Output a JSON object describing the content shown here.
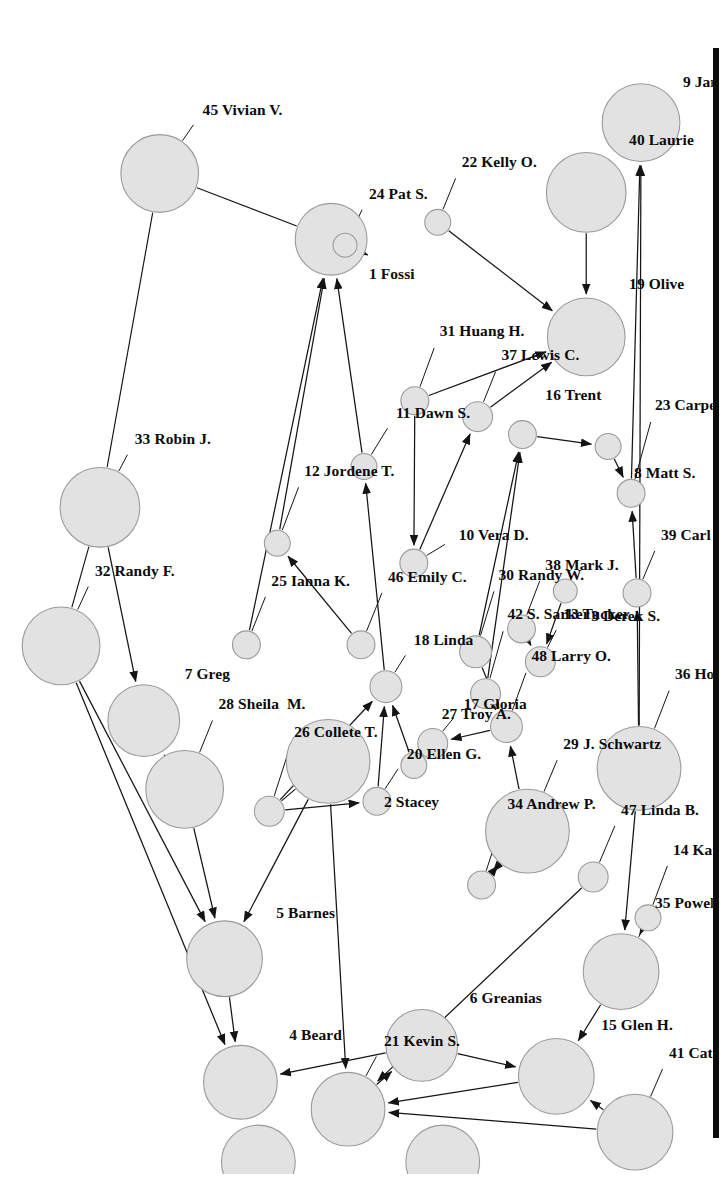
{
  "figure": {
    "type": "social-network-graph",
    "orientation": "rotated-90-clockwise",
    "node_count": 48,
    "background_color": "#ffffff",
    "node_fill_color": "#e2e2e2",
    "node_stroke_color": "#9a9a9a",
    "edge_color": "#141414",
    "page_edge_bar_color": "#0d0d0d"
  },
  "nodes": [
    {
      "id": 1,
      "label": "1 Fossi",
      "x": 222,
      "y": 383,
      "r": 36,
      "lx": 258,
      "ly": 345,
      "anchor": "start"
    },
    {
      "id": 2,
      "label": "2 Stacey",
      "x": 746,
      "y": 386,
      "r": 42,
      "lx": 788,
      "ly": 330,
      "anchor": "start"
    },
    {
      "id": 3,
      "label": "3 Derek S.",
      "x": 575,
      "y": 148,
      "r": 12,
      "lx": 602,
      "ly": 122,
      "anchor": "start"
    },
    {
      "id": 4,
      "label": "4 Beard",
      "x": 1068,
      "y": 474,
      "r": 37,
      "lx": 1022,
      "ly": 425,
      "anchor": "start"
    },
    {
      "id": 5,
      "label": "5 Barnes",
      "x": 944,
      "y": 490,
      "r": 38,
      "lx": 900,
      "ly": 438,
      "anchor": "start"
    },
    {
      "id": 6,
      "label": "6 Greanias",
      "x": 1031,
      "y": 292,
      "r": 36,
      "lx": 985,
      "ly": 244,
      "anchor": "start"
    },
    {
      "id": 7,
      "label": "7 Greg",
      "x": 705,
      "y": 571,
      "r": 36,
      "lx": 660,
      "ly": 530,
      "anchor": "start"
    },
    {
      "id": 8,
      "label": "8 Matt S.",
      "x": 430,
      "y": 105,
      "r": 13,
      "lx": 458,
      "ly": 79,
      "anchor": "start"
    },
    {
      "id": 9,
      "label": "9 Jana",
      "x": 105,
      "y": 72,
      "r": 39,
      "lx": 66,
      "ly": 30,
      "anchor": "start"
    },
    {
      "id": 10,
      "label": "10 Vera D.",
      "x": 547,
      "y": 300,
      "r": 14,
      "lx": 520,
      "ly": 255,
      "anchor": "start"
    },
    {
      "id": 11,
      "label": "11 Dawn S.",
      "x": 450,
      "y": 350,
      "r": 13,
      "lx": 398,
      "ly": 318,
      "anchor": "start"
    },
    {
      "id": 12,
      "label": "12 Jordene T.",
      "x": 527,
      "y": 437,
      "r": 13,
      "lx": 456,
      "ly": 410,
      "anchor": "start"
    },
    {
      "id": 13,
      "label": "13 Tucker",
      "x": 646,
      "y": 173,
      "r": 15,
      "lx": 600,
      "ly": 150,
      "anchor": "start"
    },
    {
      "id": 14,
      "label": "14 Kathy I",
      "x": 903,
      "y": 65,
      "r": 13,
      "lx": 836,
      "ly": 40,
      "anchor": "start"
    },
    {
      "id": 15,
      "label": "15 Glen H.",
      "x": 1062,
      "y": 157,
      "r": 38,
      "lx": 1012,
      "ly": 112,
      "anchor": "start"
    },
    {
      "id": 16,
      "label": "16 Trent",
      "x": 418,
      "y": 191,
      "r": 14,
      "lx": 380,
      "ly": 168,
      "anchor": "start"
    },
    {
      "id": 17,
      "label": "17 Gloria",
      "x": 728,
      "y": 281,
      "r": 15,
      "lx": 690,
      "ly": 250,
      "anchor": "start"
    },
    {
      "id": 18,
      "label": "18 Linda",
      "x": 671,
      "y": 328,
      "r": 16,
      "lx": 626,
      "ly": 300,
      "anchor": "start"
    },
    {
      "id": 19,
      "label": "19 Olive",
      "x": 320,
      "y": 127,
      "r": 39,
      "lx": 268,
      "ly": 84,
      "anchor": "start"
    },
    {
      "id": 20,
      "label": "20 Ellen G.",
      "x": 786,
      "y": 337,
      "r": 14,
      "lx": 740,
      "ly": 307,
      "anchor": "start"
    },
    {
      "id": 21,
      "label": "21 Kevin S.",
      "x": 1095,
      "y": 366,
      "r": 37,
      "lx": 1028,
      "ly": 330,
      "anchor": "start"
    },
    {
      "id": 22,
      "label": "22 Kelly O.",
      "x": 205,
      "y": 276,
      "r": 13,
      "lx": 146,
      "ly": 252,
      "anchor": "start"
    },
    {
      "id": 23,
      "label": "23 Carpenter",
      "x": 477,
      "y": 82,
      "r": 14,
      "lx": 390,
      "ly": 58,
      "anchor": "start"
    },
    {
      "id": 24,
      "label": "24 Pat S.",
      "x": 228,
      "y": 369,
      "r": 12,
      "lx": 178,
      "ly": 345,
      "anchor": "start"
    },
    {
      "id": 25,
      "label": "25 Ianna K.",
      "x": 629,
      "y": 468,
      "r": 14,
      "lx": 566,
      "ly": 443,
      "anchor": "start"
    },
    {
      "id": 26,
      "label": "26 Collete T.",
      "x": 796,
      "y": 445,
      "r": 15,
      "lx": 718,
      "ly": 420,
      "anchor": "start"
    },
    {
      "id": 27,
      "label": "27 Troy A.",
      "x": 750,
      "y": 300,
      "r": 13,
      "lx": 700,
      "ly": 272,
      "anchor": "start"
    },
    {
      "id": 28,
      "label": "28 Sheila  M.",
      "x": 774,
      "y": 530,
      "r": 39,
      "lx": 690,
      "ly": 496,
      "anchor": "start"
    },
    {
      "id": 29,
      "label": "29 J. Schwartz",
      "x": 816,
      "y": 186,
      "r": 42,
      "lx": 730,
      "ly": 150,
      "anchor": "start"
    },
    {
      "id": 30,
      "label": "30 Randy W.",
      "x": 636,
      "y": 238,
      "r": 16,
      "lx": 560,
      "ly": 215,
      "anchor": "start"
    },
    {
      "id": 31,
      "label": "31 Huang H.",
      "x": 384,
      "y": 299,
      "r": 14,
      "lx": 316,
      "ly": 274,
      "anchor": "start"
    },
    {
      "id": 32,
      "label": "32 Randy F.",
      "x": 630,
      "y": 654,
      "r": 39,
      "lx": 556,
      "ly": 620,
      "anchor": "start"
    },
    {
      "id": 33,
      "label": "33 Robin J.",
      "x": 491,
      "y": 615,
      "r": 40,
      "lx": 424,
      "ly": 580,
      "anchor": "start"
    },
    {
      "id": 34,
      "label": "34 Andrew P.",
      "x": 870,
      "y": 232,
      "r": 14,
      "lx": 790,
      "ly": 206,
      "anchor": "start"
    },
    {
      "id": 35,
      "label": "35 Powell",
      "x": 957,
      "y": 92,
      "r": 38,
      "lx": 890,
      "ly": 58,
      "anchor": "start"
    },
    {
      "id": 36,
      "label": "36 Holtzclaw",
      "x": 753,
      "y": 74,
      "r": 42,
      "lx": 660,
      "ly": 38,
      "anchor": "start"
    },
    {
      "id": 37,
      "label": "37 Lewis C.",
      "x": 400,
      "y": 236,
      "r": 15,
      "lx": 340,
      "ly": 212,
      "anchor": "start"
    },
    {
      "id": 38,
      "label": "38 Mark J.",
      "x": 613,
      "y": 192,
      "r": 14,
      "lx": 550,
      "ly": 168,
      "anchor": "start"
    },
    {
      "id": 39,
      "label": "39 Carl I.",
      "x": 577,
      "y": 76,
      "r": 14,
      "lx": 520,
      "ly": 52,
      "anchor": "start"
    },
    {
      "id": 40,
      "label": "40 Laurie",
      "x": 175,
      "y": 127,
      "r": 40,
      "lx": 124,
      "ly": 84,
      "anchor": "start"
    },
    {
      "id": 41,
      "label": "41 Cathy G.",
      "x": 1118,
      "y": 78,
      "r": 38,
      "lx": 1040,
      "ly": 44,
      "anchor": "start"
    },
    {
      "id": 42,
      "label": "42 S. Sarker",
      "x": 678,
      "y": 228,
      "r": 15,
      "lx": 600,
      "ly": 206,
      "anchor": "start"
    },
    {
      "id": 43,
      "label": "43",
      "x": 1148,
      "y": 271,
      "r": 37,
      "lx": 1148,
      "ly": 271,
      "anchor": "middle",
      "hide_label": true
    },
    {
      "id": 44,
      "label": "44",
      "x": 1148,
      "y": 456,
      "r": 37,
      "lx": 1148,
      "ly": 456,
      "anchor": "middle",
      "hide_label": true
    },
    {
      "id": 45,
      "label": "45 Vivian V.",
      "x": 156,
      "y": 555,
      "r": 39,
      "lx": 94,
      "ly": 512,
      "anchor": "start"
    },
    {
      "id": 46,
      "label": "46 Emily C.",
      "x": 629,
      "y": 353,
      "r": 14,
      "lx": 562,
      "ly": 326,
      "anchor": "start"
    },
    {
      "id": 47,
      "label": "47 Linda B.",
      "x": 862,
      "y": 120,
      "r": 15,
      "lx": 796,
      "ly": 92,
      "anchor": "start"
    },
    {
      "id": 48,
      "label": "48 Larry O.",
      "x": 711,
      "y": 207,
      "r": 16,
      "lx": 642,
      "ly": 182,
      "anchor": "start"
    }
  ],
  "edges": [
    {
      "from": 23,
      "to": 9,
      "arrow": true
    },
    {
      "from": 36,
      "to": 9,
      "arrow": true
    },
    {
      "from": 40,
      "to": 19,
      "arrow": true
    },
    {
      "from": 22,
      "to": 19,
      "arrow": true
    },
    {
      "from": 31,
      "to": 19,
      "arrow": true
    },
    {
      "from": 37,
      "to": 19,
      "arrow": true
    },
    {
      "from": 24,
      "to": 1,
      "arrow": true
    },
    {
      "from": 11,
      "to": 1,
      "arrow": true
    },
    {
      "from": 12,
      "to": 1,
      "arrow": true
    },
    {
      "from": 25,
      "to": 1,
      "arrow": true
    },
    {
      "from": 45,
      "to": 1,
      "arrow": false
    },
    {
      "from": 45,
      "to": 33,
      "arrow": false
    },
    {
      "from": 33,
      "to": 7,
      "arrow": true
    },
    {
      "from": 33,
      "to": 32,
      "arrow": false
    },
    {
      "from": 32,
      "to": 5,
      "arrow": true
    },
    {
      "from": 32,
      "to": 4,
      "arrow": true
    },
    {
      "from": 28,
      "to": 7,
      "arrow": true
    },
    {
      "from": 28,
      "to": 5,
      "arrow": true
    },
    {
      "from": 5,
      "to": 4,
      "arrow": true
    },
    {
      "from": 6,
      "to": 4,
      "arrow": true
    },
    {
      "from": 2,
      "to": 5,
      "arrow": true
    },
    {
      "from": 2,
      "to": 26,
      "arrow": false
    },
    {
      "from": 26,
      "to": 20,
      "arrow": true
    },
    {
      "from": 2,
      "to": 21,
      "arrow": true
    },
    {
      "from": 21,
      "to": 6,
      "arrow": true
    },
    {
      "from": 6,
      "to": 15,
      "arrow": true
    },
    {
      "from": 15,
      "to": 21,
      "arrow": true
    },
    {
      "from": 41,
      "to": 15,
      "arrow": true
    },
    {
      "from": 41,
      "to": 21,
      "arrow": true
    },
    {
      "from": 35,
      "to": 15,
      "arrow": true
    },
    {
      "from": 36,
      "to": 35,
      "arrow": true
    },
    {
      "from": 14,
      "to": 35,
      "arrow": true
    },
    {
      "from": 47,
      "to": 21,
      "arrow": true
    },
    {
      "from": 29,
      "to": 48,
      "arrow": true
    },
    {
      "from": 48,
      "to": 17,
      "arrow": true
    },
    {
      "from": 34,
      "to": 29,
      "arrow": true
    },
    {
      "from": 30,
      "to": 48,
      "arrow": true
    },
    {
      "from": 42,
      "to": 48,
      "arrow": true
    },
    {
      "from": 38,
      "to": 13,
      "arrow": true
    },
    {
      "from": 39,
      "to": 23,
      "arrow": true
    },
    {
      "from": 8,
      "to": 23,
      "arrow": true
    },
    {
      "from": 3,
      "to": 13,
      "arrow": true
    },
    {
      "from": 16,
      "to": 8,
      "arrow": true
    },
    {
      "from": 30,
      "to": 16,
      "arrow": true
    },
    {
      "from": 42,
      "to": 16,
      "arrow": true
    },
    {
      "from": 10,
      "to": 37,
      "arrow": true
    },
    {
      "from": 31,
      "to": 10,
      "arrow": true
    },
    {
      "from": 46,
      "to": 12,
      "arrow": true
    },
    {
      "from": 27,
      "to": 18,
      "arrow": true
    },
    {
      "from": 20,
      "to": 18,
      "arrow": true
    },
    {
      "from": 26,
      "to": 18,
      "arrow": true
    },
    {
      "from": 18,
      "to": 11,
      "arrow": true
    },
    {
      "from": 36,
      "to": 39,
      "arrow": true
    },
    {
      "from": 29,
      "to": 34,
      "arrow": true
    }
  ]
}
